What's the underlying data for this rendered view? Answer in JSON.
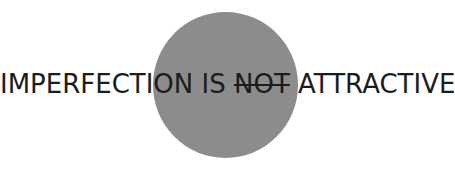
{
  "graphic": {
    "circle_color": "#8c8c8c",
    "text_color": "#1c1c1c"
  },
  "slogan": {
    "part1": "IMPERFECTION IS ",
    "struck": "NOT",
    "part2": " ATTRACTIVE"
  }
}
